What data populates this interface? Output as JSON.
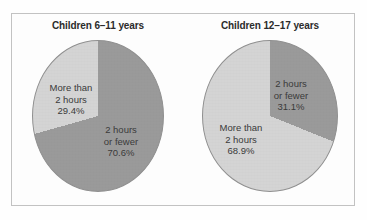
{
  "figure": {
    "background_color": "#fefefe",
    "frame_color": "#c2c2c2",
    "panels": 2
  },
  "colors": {
    "slice_dark": "#9a9a9a",
    "slice_light": "#d4d4d4",
    "slice_edge": "#8f8f8f",
    "title_text": "#2b2b2b",
    "label_text": "#3a3a3a"
  },
  "panel_left": {
    "title": "Children 6–11 years",
    "labels": {
      "more": {
        "line1": "More than",
        "line2": "2 hours",
        "value": "29.4%"
      },
      "fewer": {
        "line1": "2 hours",
        "line2": "or fewer",
        "value": "70.6%"
      }
    }
  },
  "panel_right": {
    "title": "Children 12–17 years",
    "labels": {
      "fewer": {
        "line1": "2 hours",
        "line2": "or fewer",
        "value": "31.1%"
      },
      "more": {
        "line1": "More than",
        "line2": "2 hours",
        "value": "68.9%"
      }
    }
  },
  "chart_data": [
    {
      "type": "pie",
      "title": "Children 6–11 years",
      "categories": [
        "2 hours or fewer",
        "More than 2 hours"
      ],
      "values": [
        70.6,
        29.4
      ],
      "value_labels": [
        "70.6%",
        "29.4%"
      ],
      "colors": [
        "#9a9a9a",
        "#d4d4d4"
      ],
      "units": "percent",
      "start_angle_deg": 0,
      "direction": "clockwise",
      "legend": "none",
      "grid": false,
      "notes": "Light wedge 'More than 2 hours' (29.4%) spans counter-clockwise from 12 o'clock; dark wedge '2 hours or fewer' (70.6%) fills remainder. Labels placed inside slices."
    },
    {
      "type": "pie",
      "title": "Children 12–17 years",
      "categories": [
        "2 hours or fewer",
        "More than 2 hours"
      ],
      "values": [
        31.1,
        68.9
      ],
      "value_labels": [
        "31.1%",
        "68.9%"
      ],
      "colors": [
        "#9a9a9a",
        "#d4d4d4"
      ],
      "units": "percent",
      "start_angle_deg": 0,
      "direction": "clockwise",
      "legend": "none",
      "grid": false,
      "notes": "Dark wedge '2 hours or fewer' (31.1%) spans clockwise from 12 o'clock; light wedge 'More than 2 hours' (68.9%) fills remainder. Labels placed inside slices."
    }
  ]
}
